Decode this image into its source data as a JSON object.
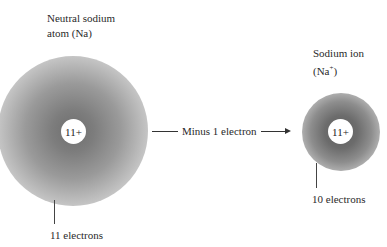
{
  "atom": {
    "title_line1": "Neutral sodium",
    "title_line2": "atom (Na)",
    "nucleus_charge": "11+",
    "electron_label": "11 electrons"
  },
  "transition": {
    "label": "Minus 1 electron"
  },
  "ion": {
    "title_line1": "Sodium ion",
    "title_line2_base": "(Na",
    "title_line2_sup": "+",
    "title_line2_close": ")",
    "nucleus_charge": "11+",
    "electron_label": "10 electrons"
  }
}
